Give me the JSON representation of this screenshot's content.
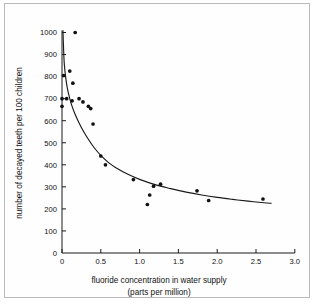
{
  "chart_data": {
    "type": "scatter",
    "title": "",
    "subtitle": "",
    "xlabel": "fluoride concentration in water supply",
    "xlabel_line2": "(parts per million)",
    "ylabel": "number of decayed teeth per 100 children",
    "xlim": [
      0,
      3.0
    ],
    "ylim": [
      0,
      1000
    ],
    "xticks": [
      "0",
      "0.5",
      "1.0",
      "1.5",
      "2.0",
      "2.5",
      "3.0"
    ],
    "xtick_values": [
      0,
      0.5,
      1.0,
      1.5,
      2.0,
      2.5,
      3.0
    ],
    "yticks": [
      "0",
      "100",
      "200",
      "300",
      "400",
      "500",
      "600",
      "700",
      "800",
      "900",
      "1000"
    ],
    "ytick_values": [
      0,
      100,
      200,
      300,
      400,
      500,
      600,
      700,
      800,
      900,
      1000
    ],
    "grid": false,
    "legend": null,
    "marker": "filled-circle",
    "marker_color": "#111111",
    "curve_color": "#1a1a1a",
    "axis_color": "#1a1a1a",
    "background_color": "#fefefe",
    "frame_color": "#b9b9b9",
    "series": [
      {
        "name": "observed",
        "points": [
          {
            "x": 0.0,
            "y": 665
          },
          {
            "x": 0.0,
            "y": 700
          },
          {
            "x": 0.02,
            "y": 805
          },
          {
            "x": 0.06,
            "y": 700
          },
          {
            "x": 0.1,
            "y": 825
          },
          {
            "x": 0.13,
            "y": 690
          },
          {
            "x": 0.14,
            "y": 770
          },
          {
            "x": 0.17,
            "y": 1000
          },
          {
            "x": 0.22,
            "y": 700
          },
          {
            "x": 0.27,
            "y": 685
          },
          {
            "x": 0.34,
            "y": 665
          },
          {
            "x": 0.37,
            "y": 655
          },
          {
            "x": 0.4,
            "y": 585
          },
          {
            "x": 0.5,
            "y": 440
          },
          {
            "x": 0.56,
            "y": 400
          },
          {
            "x": 0.92,
            "y": 333
          },
          {
            "x": 1.1,
            "y": 220
          },
          {
            "x": 1.13,
            "y": 263
          },
          {
            "x": 1.18,
            "y": 303
          },
          {
            "x": 1.27,
            "y": 312
          },
          {
            "x": 1.74,
            "y": 282
          },
          {
            "x": 1.89,
            "y": 238
          },
          {
            "x": 2.59,
            "y": 245
          }
        ]
      }
    ],
    "fit_curve": {
      "name": "fitted decay curve",
      "points": [
        {
          "x": 0.012,
          "y": 1010
        },
        {
          "x": 0.02,
          "y": 930
        },
        {
          "x": 0.03,
          "y": 855
        },
        {
          "x": 0.05,
          "y": 790
        },
        {
          "x": 0.07,
          "y": 745
        },
        {
          "x": 0.1,
          "y": 700
        },
        {
          "x": 0.13,
          "y": 665
        },
        {
          "x": 0.17,
          "y": 628
        },
        {
          "x": 0.22,
          "y": 590
        },
        {
          "x": 0.28,
          "y": 550
        },
        {
          "x": 0.35,
          "y": 510
        },
        {
          "x": 0.42,
          "y": 475
        },
        {
          "x": 0.5,
          "y": 443
        },
        {
          "x": 0.6,
          "y": 410
        },
        {
          "x": 0.7,
          "y": 386
        },
        {
          "x": 0.85,
          "y": 357
        },
        {
          "x": 1.0,
          "y": 334
        },
        {
          "x": 1.2,
          "y": 310
        },
        {
          "x": 1.4,
          "y": 292
        },
        {
          "x": 1.6,
          "y": 276
        },
        {
          "x": 1.8,
          "y": 263
        },
        {
          "x": 2.0,
          "y": 252
        },
        {
          "x": 2.2,
          "y": 243
        },
        {
          "x": 2.4,
          "y": 235
        },
        {
          "x": 2.6,
          "y": 228
        },
        {
          "x": 2.7,
          "y": 225
        }
      ]
    }
  }
}
